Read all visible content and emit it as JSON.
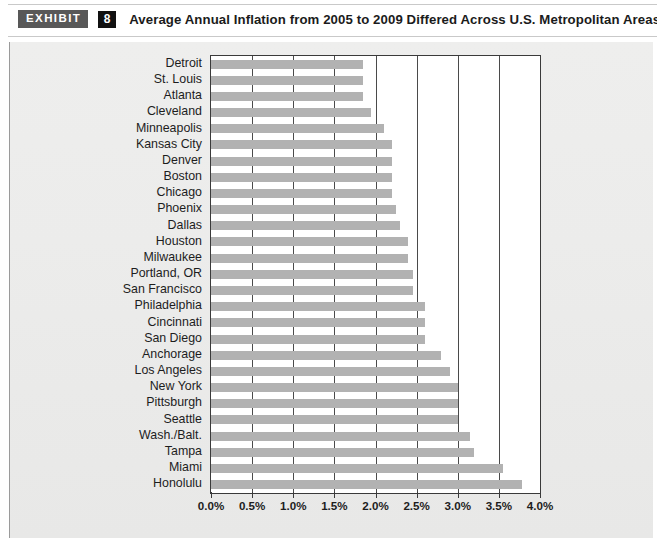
{
  "header": {
    "badge_label": "EXHIBIT",
    "exhibit_number": "8",
    "title": "Average Annual Inflation from 2005 to 2009 Differed Across U.S. Metropolitan Areas"
  },
  "colors": {
    "bar": "#b2b2b2",
    "panel_background": "#ececeb",
    "plot_background": "#ffffff",
    "axis": "#3a3a3a",
    "badge_background": "#585858",
    "number_background": "#111111",
    "text": "#1d1d1d"
  },
  "chart_data": {
    "type": "bar",
    "orientation": "horizontal",
    "title": "Average Annual Inflation from 2005 to 2009 Differed Across U.S. Metropolitan Areas",
    "xlabel": "",
    "ylabel": "",
    "xlim": [
      0,
      4.0
    ],
    "xticks": [
      0.0,
      0.5,
      1.0,
      1.5,
      2.0,
      2.5,
      3.0,
      3.5,
      4.0
    ],
    "xtick_labels": [
      "0.0%",
      "0.5%",
      "1.0%",
      "1.5%",
      "2.0%",
      "2.5%",
      "3.0%",
      "3.5%",
      "4.0%"
    ],
    "grid": true,
    "legend": null,
    "value_unit": "percent",
    "categories": [
      "Detroit",
      "St. Louis",
      "Atlanta",
      "Cleveland",
      "Minneapolis",
      "Kansas City",
      "Denver",
      "Boston",
      "Chicago",
      "Phoenix",
      "Dallas",
      "Houston",
      "Milwaukee",
      "Portland, OR",
      "San Francisco",
      "Philadelphia",
      "Cincinnati",
      "San Diego",
      "Anchorage",
      "Los Angeles",
      "New York",
      "Pittsburgh",
      "Seattle",
      "Wash./Balt.",
      "Tampa",
      "Miami",
      "Honolulu"
    ],
    "values": [
      1.85,
      1.85,
      1.85,
      1.95,
      2.1,
      2.2,
      2.2,
      2.2,
      2.2,
      2.25,
      2.3,
      2.4,
      2.4,
      2.45,
      2.45,
      2.6,
      2.6,
      2.6,
      2.8,
      2.9,
      3.0,
      3.0,
      3.0,
      3.15,
      3.2,
      3.55,
      3.78
    ]
  }
}
